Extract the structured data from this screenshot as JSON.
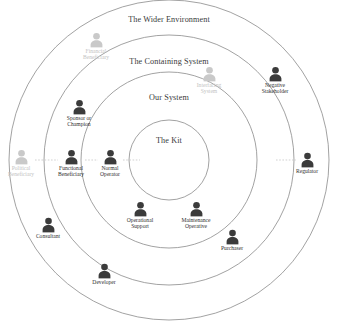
{
  "diagram": {
    "type": "onion-ring-stakeholder-map",
    "center": {
      "x": 169,
      "y": 160
    },
    "stroke_color": "#8a8a8a",
    "actor_color": "#3b3b3b",
    "actor_faded_color": "#c9c9c9",
    "background": "#ffffff",
    "rings": [
      {
        "id": "kit",
        "label": "The Kit",
        "radius": 40,
        "label_x": 169,
        "label_y": 140
      },
      {
        "id": "our-system",
        "label": "Our System",
        "radius": 88,
        "label_x": 169,
        "label_y": 97
      },
      {
        "id": "containing",
        "label": "The Containing System",
        "radius": 125,
        "label_x": 169,
        "label_y": 61
      },
      {
        "id": "wider",
        "label": "The Wider Environment",
        "radius": 160,
        "label_x": 169,
        "label_y": 19
      }
    ],
    "actors": [
      {
        "name": "financial-beneficiary",
        "label": "Financial\nBeneficiary",
        "x": 96,
        "y": 46,
        "faded": true
      },
      {
        "name": "interfacing-system",
        "label": "Interfacing\nSystem",
        "x": 209,
        "y": 80,
        "faded": true
      },
      {
        "name": "political-beneficiary",
        "label": "Political\nBeneficiary",
        "x": 21,
        "y": 163,
        "faded": true
      },
      {
        "name": "negative-stakeholder",
        "label": "Negative\nStakeholder",
        "x": 275,
        "y": 80,
        "faded": false
      },
      {
        "name": "sponsor-or-champion",
        "label": "Sponsor or\nChampion",
        "x": 79,
        "y": 113,
        "faded": false
      },
      {
        "name": "functional-beneficiary",
        "label": "Functional\nBeneficiary",
        "x": 71,
        "y": 163,
        "faded": false
      },
      {
        "name": "normal-operator",
        "label": "Normal\nOperator",
        "x": 110,
        "y": 163,
        "faded": false
      },
      {
        "name": "regulator",
        "label": "Regulator",
        "x": 307,
        "y": 163,
        "faded": false
      },
      {
        "name": "operational-support",
        "label": "Operational\nSupport",
        "x": 140,
        "y": 215,
        "faded": false
      },
      {
        "name": "maintenance-operative",
        "label": "Maintenance\nOperative",
        "x": 196,
        "y": 215,
        "faded": false
      },
      {
        "name": "purchaser",
        "label": "Purchaser",
        "x": 232,
        "y": 240,
        "faded": false
      },
      {
        "name": "consultant",
        "label": "Consultant",
        "x": 48,
        "y": 228,
        "faded": false
      },
      {
        "name": "developer",
        "label": "Developer",
        "x": 104,
        "y": 274,
        "faded": false
      }
    ],
    "connectors": [
      {
        "from": "political-beneficiary",
        "to": "functional-beneficiary",
        "x1": 35,
        "y1": 160,
        "x2": 58,
        "y2": 160
      },
      {
        "from": "functional-beneficiary",
        "to": "normal-operator",
        "x1": 85,
        "y1": 160,
        "x2": 98,
        "y2": 160
      },
      {
        "from": "normal-operator",
        "to": "the-kit",
        "x1": 123,
        "y1": 160,
        "x2": 140,
        "y2": 160
      },
      {
        "from": "the-kit",
        "to": "regulator",
        "x1": 276,
        "y1": 160,
        "x2": 296,
        "y2": 160
      }
    ]
  }
}
